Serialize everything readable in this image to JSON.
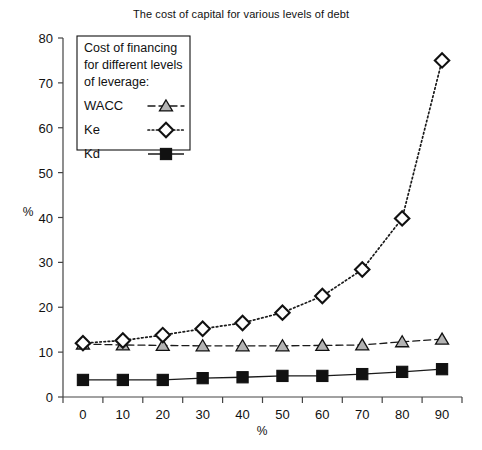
{
  "chart_data": {
    "type": "line",
    "title": "The cost of capital for various levels of debt",
    "xlabel": "%",
    "ylabel": "%",
    "xlim": [
      0,
      90
    ],
    "ylim": [
      0,
      80
    ],
    "ytick_step": 10,
    "grid": false,
    "legend_position": "top-left",
    "legend_title": [
      "Cost of financing",
      "for different levels",
      "of leverage:"
    ],
    "categories": [
      0,
      10,
      20,
      30,
      40,
      50,
      60,
      70,
      80,
      90
    ],
    "xticklabels": [
      "0",
      "10",
      "20",
      "30",
      "40",
      "50",
      "60",
      "70",
      "80",
      "90"
    ],
    "yticklabels": [
      "0",
      "10",
      "20",
      "30",
      "40",
      "50",
      "60",
      "70",
      "80"
    ],
    "series": [
      {
        "name": "WACC",
        "marker": "triangle",
        "marker_fill": "#b3b3b3",
        "line_style": "dashed",
        "color": "#1a1a1a",
        "values": [
          11.8,
          11.6,
          11.5,
          11.4,
          11.4,
          11.4,
          11.5,
          11.6,
          12.3,
          12.9
        ]
      },
      {
        "name": "Ke",
        "marker": "diamond",
        "marker_fill": "#ffffff",
        "line_style": "dotted",
        "color": "#1a1a1a",
        "values": [
          12.0,
          12.6,
          13.8,
          15.2,
          16.5,
          18.8,
          22.5,
          28.4,
          39.8,
          75.0
        ]
      },
      {
        "name": "Kd",
        "marker": "square",
        "marker_fill": "#111111",
        "line_style": "solid",
        "color": "#1a1a1a",
        "values": [
          3.8,
          3.8,
          3.8,
          4.2,
          4.4,
          4.7,
          4.7,
          5.1,
          5.6,
          6.2
        ]
      }
    ]
  }
}
